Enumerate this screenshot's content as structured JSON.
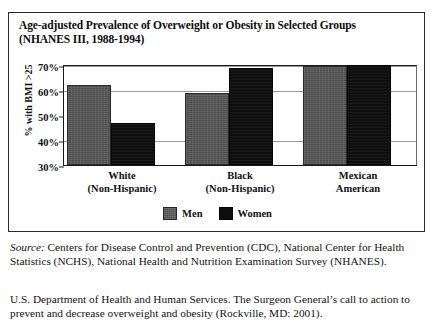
{
  "figure": {
    "title": "Age-adjusted Prevalence of Overweight or Obesity in Selected Groups (NHANES III, 1988-1994)",
    "title_line1": "Age-adjusted Prevalence of Overweight or Obesity in Selected Groups",
    "title_line2": "(NHANES III, 1988-1994)"
  },
  "chart_data": {
    "type": "bar",
    "title": "Age-adjusted Prevalence of Overweight or Obesity in Selected Groups (NHANES III, 1988-1994)",
    "xlabel": "",
    "ylabel": "% with BMI >25",
    "ylim": [
      30,
      70
    ],
    "ytick_labels": [
      "70%",
      "60%",
      "50%",
      "40%",
      "30%"
    ],
    "ytick_values": [
      70,
      60,
      50,
      40,
      30
    ],
    "grid": true,
    "legend_position": "bottom-center",
    "categories": [
      "White (Non-Hispanic)",
      "Black (Non-Hispanic)",
      "Mexican American"
    ],
    "category_lines": [
      [
        "White",
        "(Non-Hispanic)"
      ],
      [
        "Black",
        "(Non-Hispanic)"
      ],
      [
        "Mexican",
        "American"
      ]
    ],
    "series": [
      {
        "name": "Men",
        "color": "#4c4c4c",
        "values": [
          62,
          59,
          69.5
        ]
      },
      {
        "name": "Women",
        "color": "#0e0e0e",
        "values": [
          47,
          69,
          70
        ]
      }
    ]
  },
  "source": {
    "lead": "Source:",
    "text": " Centers for Disease Control and Prevention (CDC), National Center for Health Statistics (NCHS), National Health and Nutrition Examination Survey (NHANES)."
  },
  "note": {
    "text": "U.S. Department of Health and Human Services. The Surgeon General’s call to action to prevent and decrease overweight and obesity (Rockville, MD: 2001)."
  }
}
